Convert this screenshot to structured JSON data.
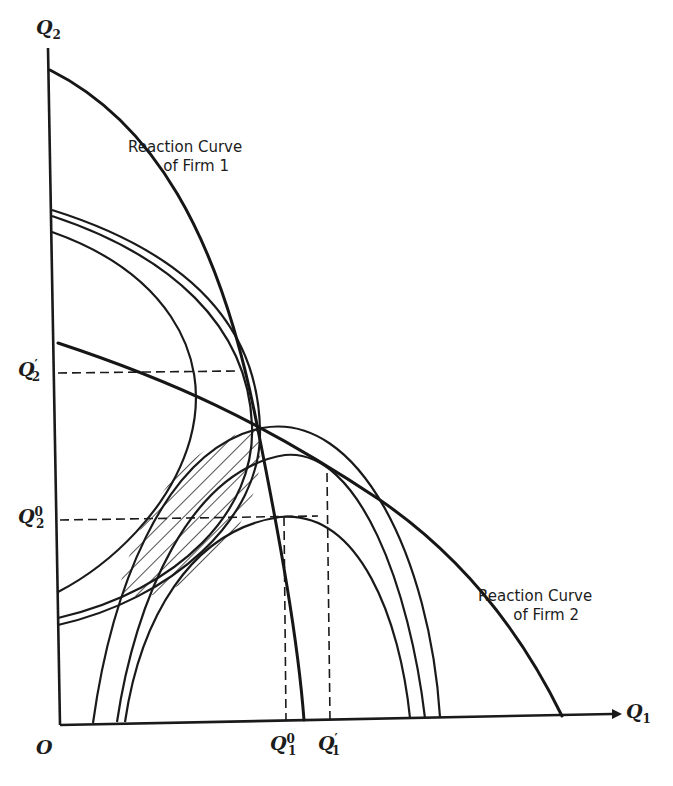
{
  "diagram": {
    "type": "duopoly reaction curves with isoprofit contours",
    "axes": {
      "origin_label": "O",
      "x_axis": {
        "label": "Q",
        "subscript": "1"
      },
      "y_axis": {
        "label": "Q",
        "subscript": "2"
      }
    },
    "x_ticks": [
      {
        "label": "Q",
        "subscript": "1",
        "superscript": "0"
      },
      {
        "label": "Q",
        "subscript": "1",
        "superscript": "′"
      }
    ],
    "y_ticks": [
      {
        "label": "Q",
        "subscript": "2",
        "superscript": "′"
      },
      {
        "label": "Q",
        "subscript": "2",
        "superscript": "0"
      }
    ],
    "curve_labels": {
      "firm1": {
        "line1": "Reaction Curve",
        "line2": "of Firm 1"
      },
      "firm2": {
        "line1": "Reaction Curve",
        "line2": "of Firm 2"
      }
    },
    "elements": {
      "reaction_curves": 2,
      "firm1_isoprofit_curves": 3,
      "firm2_isoprofit_curves": 3,
      "hatched_region": "lens between isoprofit curves through the intersection point",
      "dashed_guides": [
        "Q2′",
        "Q2⁰",
        "Q1⁰",
        "Q1′"
      ]
    },
    "colors": {
      "ink": "#1a1a1a",
      "background": "#ffffff"
    }
  }
}
